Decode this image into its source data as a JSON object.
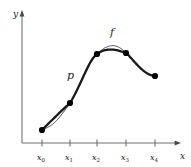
{
  "figure": {
    "title": "",
    "background_color": "#ffffff",
    "axis_color": "#707070",
    "curve_p_color": "#1a1a1a",
    "curve_f_color": "#4d4d4d",
    "marker_color": "#000000"
  },
  "axes": {
    "x_axis_label": "x",
    "y_axis_label": "y",
    "x_tick_labels": [
      "x0",
      "x1",
      "x2",
      "x3",
      "x4"
    ],
    "x_tick_bases": [
      "x",
      "x",
      "x",
      "x",
      "x"
    ],
    "x_tick_subscripts": [
      "0",
      "1",
      "2",
      "3",
      "4"
    ],
    "y_tick_labels": [],
    "grid": false
  },
  "labels": {
    "curve_f": "f",
    "curve_p": "p"
  },
  "chart_data": {
    "type": "line",
    "title": "",
    "xlabel": "x",
    "ylabel": "y",
    "grid": false,
    "legend_position": "inline-annotation",
    "x_tick_labels": [
      "x0",
      "x1",
      "x2",
      "x3",
      "x4"
    ],
    "x_tick_pixels": [
      42,
      70,
      97,
      126,
      155
    ],
    "axis_origin_pixel": [
      22,
      143
    ],
    "xlim_pixels": [
      22,
      180
    ],
    "ylim_pixels": [
      143,
      12
    ],
    "nodes": {
      "name": "interpolation nodes",
      "x": [
        42,
        70,
        97,
        126,
        155
      ],
      "y": [
        130,
        103,
        54,
        53,
        76
      ],
      "marker": "filled-circle",
      "marker_radius": 3.1
    },
    "series": [
      {
        "name": "f",
        "label": "f",
        "style": "thin",
        "color": "#4d4d4d",
        "width": 1.0,
        "description": "smooth underlying function through the five nodes; dips slightly below p just after x0 and bulges above p between x2 and x3",
        "points": [
          [
            42,
            130
          ],
          [
            46,
            128.2
          ],
          [
            50,
            126.0
          ],
          [
            54,
            123.0
          ],
          [
            58,
            119.0
          ],
          [
            62,
            114.0
          ],
          [
            66,
            108.8
          ],
          [
            70,
            103.0
          ],
          [
            74,
            95.5
          ],
          [
            78,
            87.5
          ],
          [
            82,
            78.5
          ],
          [
            86,
            70.0
          ],
          [
            90,
            62.0
          ],
          [
            93.5,
            57.0
          ],
          [
            97,
            54.0
          ],
          [
            101,
            50.5
          ],
          [
            105,
            47.8
          ],
          [
            109,
            46.2
          ],
          [
            113,
            45.6
          ],
          [
            117,
            46.4
          ],
          [
            121,
            48.6
          ],
          [
            126,
            53.0
          ],
          [
            131,
            58.5
          ],
          [
            136,
            64.0
          ],
          [
            141,
            69.0
          ],
          [
            146,
            72.8
          ],
          [
            151,
            75.2
          ],
          [
            155,
            76.0
          ]
        ]
      },
      {
        "name": "p",
        "label": "p",
        "style": "thick",
        "color": "#1a1a1a",
        "width": 2.3,
        "description": "interpolating polynomial / spline through the same five nodes",
        "points": [
          [
            42,
            130
          ],
          [
            46,
            126.0
          ],
          [
            50,
            122.0
          ],
          [
            54,
            118.2
          ],
          [
            58,
            114.2
          ],
          [
            62,
            110.4
          ],
          [
            66,
            106.6
          ],
          [
            70,
            103.0
          ],
          [
            74,
            96.0
          ],
          [
            78,
            88.0
          ],
          [
            82,
            79.5
          ],
          [
            86,
            71.0
          ],
          [
            90,
            63.0
          ],
          [
            93.5,
            57.6
          ],
          [
            97,
            54.0
          ],
          [
            101,
            51.6
          ],
          [
            105,
            50.2
          ],
          [
            109,
            49.6
          ],
          [
            113,
            49.6
          ],
          [
            117,
            50.2
          ],
          [
            121,
            51.4
          ],
          [
            126,
            53.0
          ],
          [
            131,
            58.0
          ],
          [
            136,
            63.6
          ],
          [
            141,
            68.6
          ],
          [
            146,
            72.6
          ],
          [
            151,
            75.2
          ],
          [
            155,
            76.0
          ]
        ]
      }
    ],
    "annotations": [
      {
        "text": "f",
        "x_pixel": 112,
        "y_pixel": 33
      },
      {
        "text": "p",
        "x_pixel": 70,
        "y_pixel": 76
      }
    ]
  }
}
